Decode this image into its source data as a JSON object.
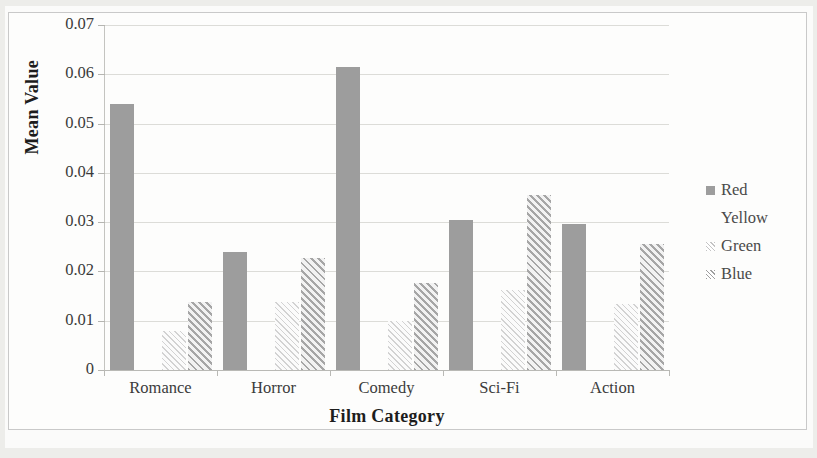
{
  "chart_data": {
    "type": "bar",
    "title": "",
    "xlabel": "Film Category",
    "ylabel": "Mean Value",
    "categories": [
      "Romance",
      "Horror",
      "Comedy",
      "Sci-Fi",
      "Action"
    ],
    "series": [
      {
        "name": "Red",
        "values": [
          0.054,
          0.024,
          0.0615,
          0.0305,
          0.0296
        ]
      },
      {
        "name": "Yellow",
        "values": [
          0,
          0,
          0,
          0,
          0
        ]
      },
      {
        "name": "Green",
        "values": [
          0.008,
          0.0138,
          0.01,
          0.0163,
          0.0134
        ]
      },
      {
        "name": "Blue",
        "values": [
          0.0139,
          0.0227,
          0.0176,
          0.0355,
          0.0255
        ]
      }
    ],
    "ylim": [
      0,
      0.07
    ],
    "ytick_labels": [
      "0",
      "0.01",
      "0.02",
      "0.03",
      "0.04",
      "0.05",
      "0.06",
      "0.07"
    ],
    "ytick_values": [
      0,
      0.01,
      0.02,
      0.03,
      0.04,
      0.05,
      0.06,
      0.07
    ],
    "grid": true,
    "legend_position": "right",
    "legend_entries": [
      "Red",
      "Yellow",
      "Green",
      "Blue"
    ],
    "series_styles": [
      "solid-gray",
      "blank",
      "light-diagonal-hatch",
      "dark-diagonal-hatch"
    ],
    "colors": {
      "red_series": "#9d9d9d",
      "yellow_series": "#efefef",
      "green_series": "#d2d2d2",
      "blue_series": "#a6a6a6",
      "gridline": "#dcdcd8",
      "axis": "#b9b9b5",
      "text": "#3a3a3a",
      "background": "#fdfdfc"
    }
  }
}
